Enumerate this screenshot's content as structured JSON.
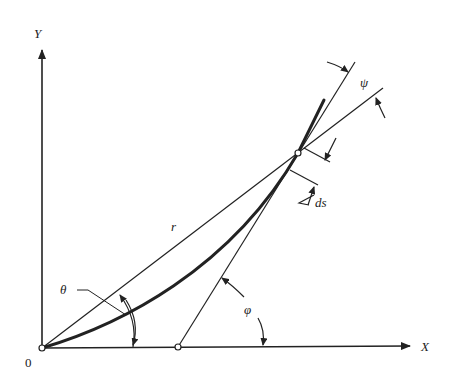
{
  "diagram": {
    "axes": {
      "y_label": "Y",
      "x_label": "X",
      "origin_label": "0"
    },
    "labels": {
      "radius": "r",
      "theta": "θ",
      "phi": "φ",
      "psi": "ψ",
      "arc_element": "ds"
    },
    "colors": {
      "stroke": "#222222",
      "background": "#ffffff"
    }
  }
}
